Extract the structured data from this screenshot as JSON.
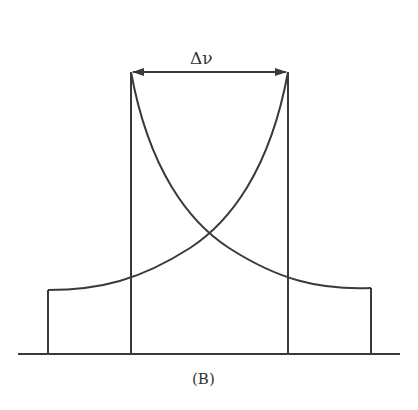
{
  "diagram": {
    "label_linewidth": "Δν",
    "caption": "(B)",
    "stroke_color": "#3a3a3a",
    "elements": [
      "baseline",
      "left-step-profile",
      "right-step-profile",
      "left-vertical-line",
      "right-vertical-line",
      "rising-exponential-curve",
      "falling-exponential-curve",
      "double-arrow-linewidth"
    ]
  }
}
